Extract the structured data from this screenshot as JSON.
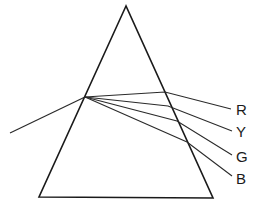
{
  "diagram": {
    "type": "prism-dispersion",
    "prism": {
      "apex": [
        126,
        6
      ],
      "bottom_left": [
        39,
        197
      ],
      "bottom_right": [
        213,
        198
      ]
    },
    "incident_ray": {
      "from": [
        10,
        133
      ],
      "to": [
        85,
        97
      ]
    },
    "rays": [
      {
        "name": "R",
        "label": "R",
        "exit_point": [
          165,
          92
        ],
        "end_point": [
          231,
          109
        ],
        "label_pos": [
          236,
          115
        ]
      },
      {
        "name": "Y",
        "label": "Y",
        "exit_point": [
          168,
          106
        ],
        "end_point": [
          232,
          131
        ],
        "label_pos": [
          236,
          137
        ]
      },
      {
        "name": "G",
        "label": "G",
        "exit_point": [
          177,
          121
        ],
        "end_point": [
          232,
          155
        ],
        "label_pos": [
          236,
          162
        ]
      },
      {
        "name": "B",
        "label": "B",
        "exit_point": [
          187,
          142
        ],
        "end_point": [
          232,
          176
        ],
        "label_pos": [
          236,
          184
        ]
      }
    ]
  },
  "labels": {
    "red": "R",
    "yellow": "Y",
    "green": "G",
    "blue": "B"
  }
}
